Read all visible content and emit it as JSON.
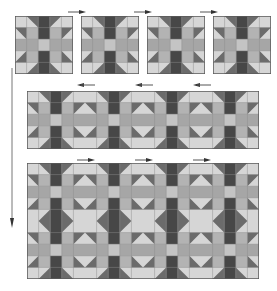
{
  "diagram": {
    "colors": {
      "background": "#ffffff",
      "light": "#d6d6d6",
      "medium": "#b3b3b3",
      "band": "#a6a6a6",
      "band_center": "#c4c4c4",
      "dark": "#474747",
      "triangle": "#6b6b6b",
      "outline": "#5a5a5a",
      "seam": "#8c8c8c",
      "arrow": "#444444"
    },
    "steps": [
      {
        "name": "individual-blocks",
        "description": "Four individual star blocks laid out in a row",
        "blocks": 4,
        "arrows": [
          {
            "direction": "right",
            "between": [
              1,
              2
            ]
          },
          {
            "direction": "right",
            "between": [
              2,
              3
            ]
          },
          {
            "direction": "right",
            "between": [
              3,
              4
            ]
          }
        ]
      },
      {
        "name": "joined-row",
        "description": "Blocks sewn together into one row",
        "columns": 4,
        "rows": 1,
        "pressing_arrows": [
          "left",
          "left",
          "left"
        ]
      },
      {
        "name": "joined-rows",
        "description": "Two rows sewn together",
        "columns": 4,
        "rows": 2,
        "pressing_arrows": [
          "right",
          "right",
          "right"
        ]
      }
    ],
    "flow_arrow": {
      "direction": "down"
    }
  }
}
